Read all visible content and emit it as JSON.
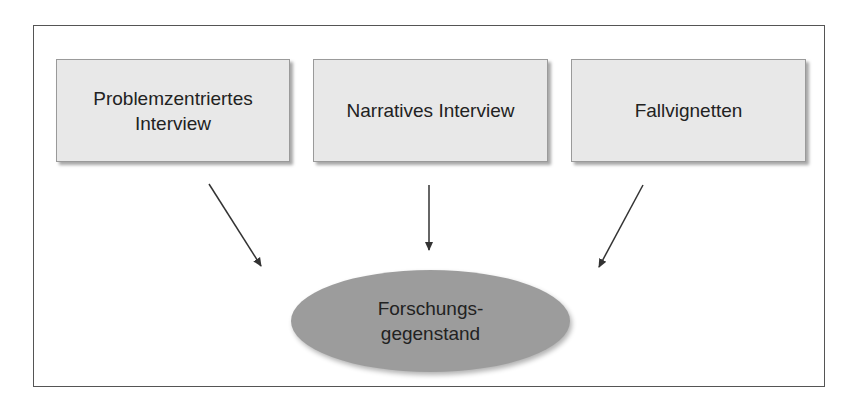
{
  "diagram": {
    "sources": [
      {
        "line1": "Problemzentriertes",
        "line2": "Interview"
      },
      {
        "line1": "Narratives Interview"
      },
      {
        "line1": "Fallvignetten"
      }
    ],
    "target": {
      "line1": "Forschungs-",
      "line2": "gegenstand"
    },
    "colors": {
      "box_fill": "#e8e8e8",
      "ellipse_fill": "#9c9c9c",
      "arrow": "#333333",
      "frame": "#555555"
    }
  }
}
